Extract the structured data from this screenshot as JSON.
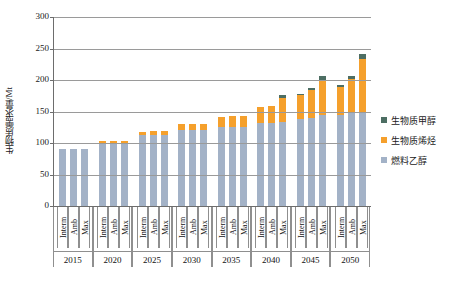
{
  "chart_data": {
    "type": "bar",
    "subtype": "stacked-bar-grouped",
    "title": "",
    "xlabel": "",
    "ylabel": "生物质需求量/Mt",
    "ylim": [
      0,
      300
    ],
    "yticks": [
      0,
      50,
      100,
      150,
      200,
      250,
      300
    ],
    "ytick_labels": [
      "0",
      "50",
      "100",
      "150",
      "200",
      "250",
      "300"
    ],
    "grid": "horizontal",
    "legend_position": "right",
    "categories": [
      "2015",
      "2020",
      "2025",
      "2030",
      "2035",
      "2040",
      "2045",
      "2050"
    ],
    "subcategories": [
      "Interm",
      "Amb",
      "Max"
    ],
    "series": [
      {
        "name": "燃料乙醇",
        "color": "#a3b2c7",
        "values": [
          [
            90,
            90,
            90
          ],
          [
            100,
            100,
            100
          ],
          [
            113,
            113,
            113
          ],
          [
            120,
            120,
            120
          ],
          [
            126,
            126,
            126
          ],
          [
            132,
            132,
            134
          ],
          [
            138,
            140,
            145
          ],
          [
            145,
            148,
            150
          ]
        ]
      },
      {
        "name": "生物质烯烃",
        "color": "#f5a02c",
        "values": [
          [
            0,
            0,
            0
          ],
          [
            3,
            3,
            3
          ],
          [
            5,
            6,
            6
          ],
          [
            10,
            10,
            10
          ],
          [
            16,
            17,
            17
          ],
          [
            25,
            26,
            38
          ],
          [
            38,
            44,
            55
          ],
          [
            44,
            54,
            84
          ]
        ]
      },
      {
        "name": "生物质甲醇",
        "color": "#4d6e63",
        "values": [
          [
            0,
            0,
            0
          ],
          [
            0,
            0,
            0
          ],
          [
            0,
            0,
            0
          ],
          [
            0,
            0,
            0
          ],
          [
            0,
            0,
            0
          ],
          [
            0,
            0,
            4
          ],
          [
            2,
            3,
            6
          ],
          [
            3,
            5,
            8
          ]
        ]
      }
    ],
    "totals": [
      [
        90,
        90,
        90
      ],
      [
        103,
        103,
        103
      ],
      [
        118,
        119,
        119
      ],
      [
        130,
        130,
        130
      ],
      [
        142,
        143,
        143
      ],
      [
        157,
        158,
        176
      ],
      [
        178,
        187,
        206
      ],
      [
        192,
        207,
        242
      ]
    ]
  },
  "legend": {
    "items": [
      {
        "label": "生物质甲醇",
        "color": "#4d6e63"
      },
      {
        "label": "生物质烯烃",
        "color": "#f5a02c"
      },
      {
        "label": "燃料乙醇",
        "color": "#a3b2c7"
      }
    ]
  }
}
